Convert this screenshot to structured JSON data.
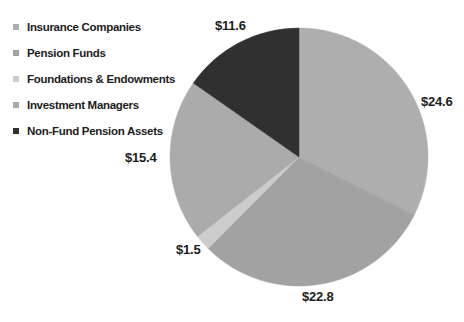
{
  "figure": {
    "background": "#ffffff",
    "text_color": "#1c1c1c"
  },
  "legend": {
    "items": [
      {
        "label": "Insurance Companies",
        "color": "#aeaeae"
      },
      {
        "label": "Pension Funds",
        "color": "#a2a2a2"
      },
      {
        "label": "Foundations & Endowments",
        "color": "#cccccc"
      },
      {
        "label": "Investment Managers",
        "color": "#ababab"
      },
      {
        "label": "Non-Fund Pension Assets",
        "color": "#303030"
      }
    ]
  },
  "chart_data": {
    "type": "pie",
    "start_angle_deg": 0,
    "direction": "clockwise",
    "legend_position": "top-left",
    "slices": [
      {
        "label": "Insurance Companies",
        "value": 24.6,
        "display": "$24.6",
        "color": "#aeaeae"
      },
      {
        "label": "Pension Funds",
        "value": 22.8,
        "display": "$22.8",
        "color": "#a2a2a2"
      },
      {
        "label": "Foundations & Endowments",
        "value": 1.5,
        "display": "$1.5",
        "color": "#cccccc"
      },
      {
        "label": "Investment Managers",
        "value": 15.4,
        "display": "$15.4",
        "color": "#ababab"
      },
      {
        "label": "Non-Fund Pension Assets",
        "value": 11.6,
        "display": "$11.6",
        "color": "#303030"
      }
    ]
  }
}
